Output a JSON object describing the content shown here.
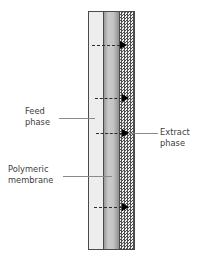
{
  "diagram": {
    "background_color": "#ffffff",
    "labels": {
      "feed": {
        "line1": "Feed",
        "line2": "phase"
      },
      "membrane": {
        "line1": "Polymeric",
        "line2": "membrane"
      },
      "extract": {
        "line1": "Extract",
        "line2": "phase"
      }
    },
    "columns": [
      {
        "id": "feed",
        "name": "Feed phase",
        "fill": "#ededed",
        "pattern": "faint-horizontal-stripes",
        "border_color": "#4a4a4a",
        "x": 88,
        "y": 11,
        "width": 16,
        "height": 239
      },
      {
        "id": "membrane",
        "name": "Polymeric membrane",
        "fill": "#c4c4c4",
        "pattern": "gray-gradient",
        "border_color": "#4a4a4a",
        "x": 104,
        "y": 11,
        "width": 16,
        "height": 239
      },
      {
        "id": "extract",
        "name": "Extract phase",
        "fill": "#4f4f4f",
        "pattern": "speckled-checker",
        "border_color": "#4a4a4a",
        "x": 120,
        "y": 11,
        "width": 15,
        "height": 239
      }
    ],
    "arrows": [
      {
        "id": "flux-1",
        "y": 41,
        "dash_x": 92,
        "dash_width": 28,
        "head_x": 120,
        "direction": "right",
        "style": "dashed"
      },
      {
        "id": "flux-2",
        "y": 94,
        "dash_x": 95,
        "dash_width": 27,
        "head_x": 122,
        "direction": "right",
        "style": "dashed"
      },
      {
        "id": "flux-3",
        "y": 129,
        "dash_x": 96,
        "dash_width": 26,
        "head_x": 122,
        "direction": "right",
        "style": "dashed"
      },
      {
        "id": "flux-4",
        "y": 203,
        "dash_x": 94,
        "dash_width": 28,
        "head_x": 122,
        "direction": "right",
        "style": "dashed"
      }
    ],
    "leader_lines": [
      {
        "id": "leader-feed",
        "target": "feed",
        "color": "#8a8a8a"
      },
      {
        "id": "leader-membrane",
        "target": "membrane",
        "color": "#8a8a8a"
      },
      {
        "id": "leader-extract",
        "target": "extract",
        "color": "#8a8a8a"
      }
    ]
  }
}
